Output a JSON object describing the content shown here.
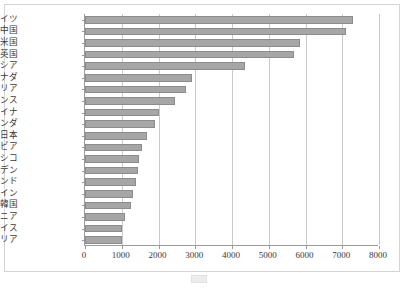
{
  "chart_data": {
    "type": "bar",
    "orientation": "horizontal",
    "title": "",
    "xlabel": "",
    "ylabel": "",
    "xlim": [
      0,
      8000
    ],
    "xticks": [
      0,
      1000,
      2000,
      3000,
      4000,
      5000,
      6000,
      7000,
      8000
    ],
    "xtick_labels": [
      "0",
      "1000",
      "2000",
      "3000",
      "4000",
      "5000",
      "6000",
      "7000",
      "8000"
    ],
    "grid": "vertical",
    "legend": "bottom",
    "bar_color": "#a6a6a6",
    "bar_edge_color": "#8c8c8c",
    "grid_color": "#c9c9c9",
    "axis_color": "#9a9a9a",
    "categories": [
      "ドイツ",
      "中国",
      "米国",
      "英国",
      "ロシア",
      "カナダ",
      "イタリア",
      "フランス",
      "ウクライナ",
      "オランダ",
      "日本",
      "サウジアラビア",
      "メキシコ",
      "スウェーデン",
      "インド",
      "スペイン",
      "韓国",
      "ルーマニア",
      "スイス",
      "オーストリア"
    ],
    "values": [
      7300,
      7100,
      5850,
      5700,
      4350,
      2900,
      2750,
      2450,
      2000,
      1900,
      1700,
      1550,
      1480,
      1450,
      1400,
      1300,
      1250,
      1100,
      1000,
      1000
    ]
  },
  "caption": {
    "legend_label": "",
    "text": ""
  }
}
